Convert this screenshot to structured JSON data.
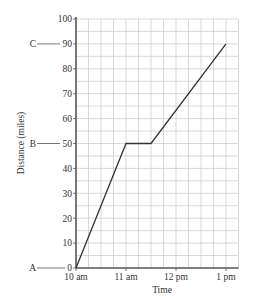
{
  "chart_data": {
    "type": "line",
    "title": "",
    "xlabel": "Time",
    "ylabel": "Distance (miles)",
    "x_ticks": [
      "10 am",
      "11 am",
      "12 pm",
      "1 pm"
    ],
    "y_ticks": [
      0,
      10,
      20,
      30,
      40,
      50,
      60,
      70,
      80,
      90,
      100
    ],
    "ylim": [
      0,
      100
    ],
    "xlim_hours": [
      10,
      13.25
    ],
    "grid": true,
    "grid_minor_x_minutes": 15,
    "grid_minor_y_miles": 5,
    "series": [
      {
        "name": "journey",
        "points": [
          {
            "time": "10:00",
            "hours": 10,
            "distance": 0
          },
          {
            "time": "11:00",
            "hours": 11,
            "distance": 50
          },
          {
            "time": "11:30",
            "hours": 11.5,
            "distance": 50
          },
          {
            "time": "13:00",
            "hours": 13,
            "distance": 90
          }
        ]
      }
    ],
    "annotations": [
      {
        "label": "A",
        "distance": 0
      },
      {
        "label": "B",
        "distance": 50
      },
      {
        "label": "C",
        "distance": 90
      }
    ]
  },
  "colors": {
    "line": "#333333",
    "axis": "#555555",
    "grid": "#c8c8c8"
  }
}
